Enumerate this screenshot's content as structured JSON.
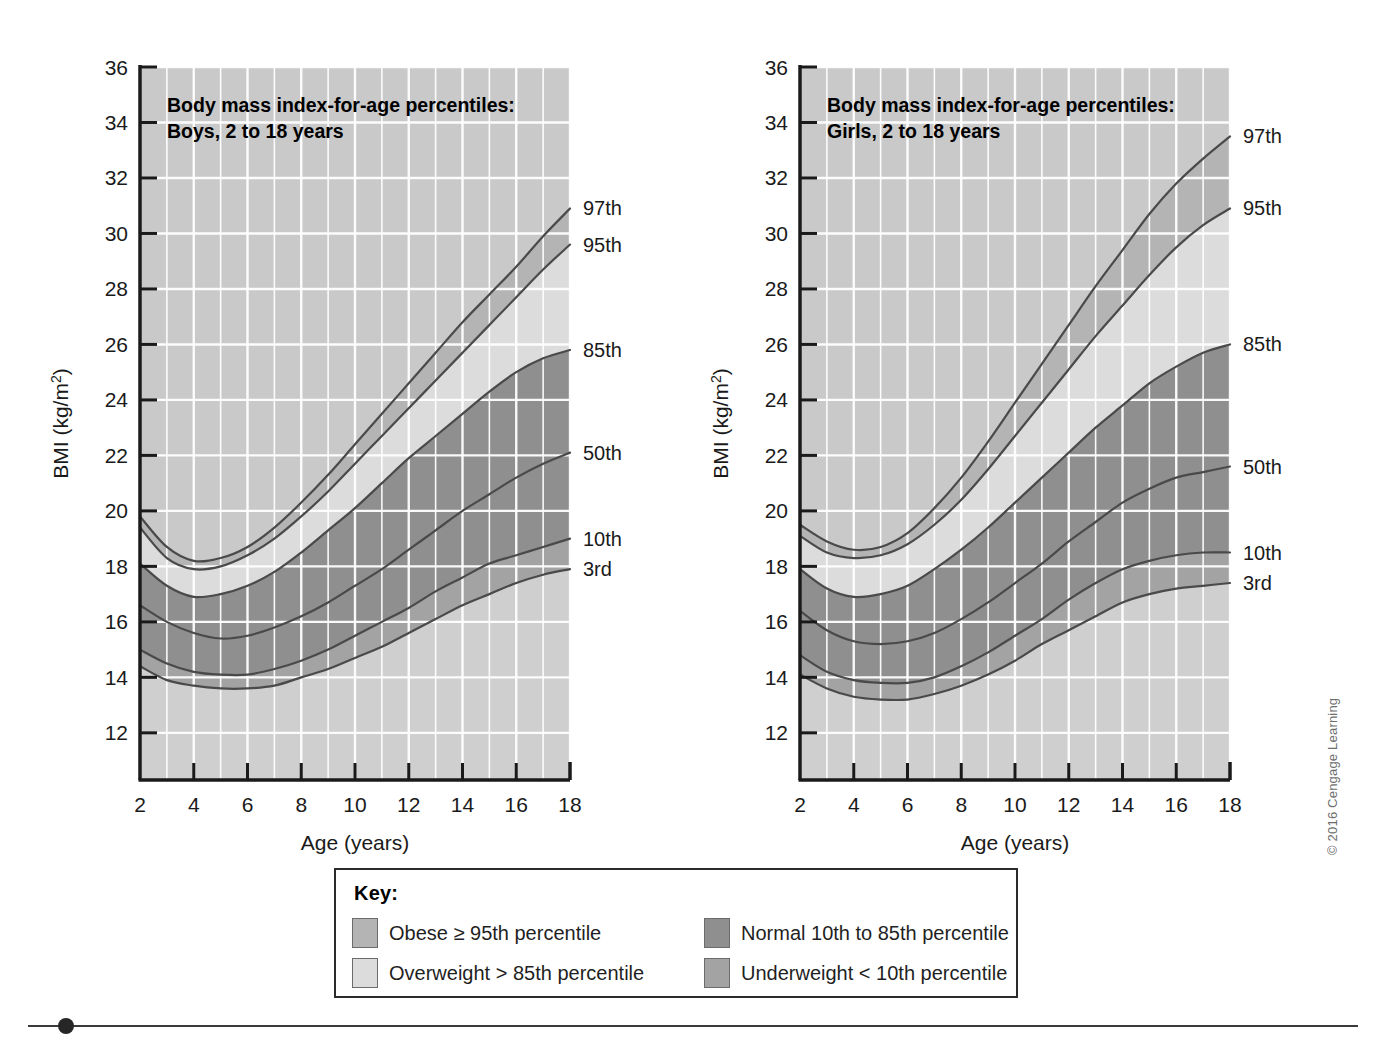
{
  "figure": {
    "copyright": "© 2016 Cengage Learning"
  },
  "legend": {
    "title": "Key:",
    "items": [
      {
        "label": "Obese ≥ 95th percentile",
        "color": "#b4b4b4"
      },
      {
        "label": "Normal 10th to 85th percentile",
        "color": "#8f8f8f"
      },
      {
        "label": "Overweight > 85th percentile",
        "color": "#dcdcdc"
      },
      {
        "label": "Underweight < 10th percentile",
        "color": "#a3a3a3"
      }
    ]
  },
  "charts": [
    {
      "id": "boys",
      "title_line1": "Body mass index-for-age percentiles:",
      "title_line2": "Boys, 2 to 18 years",
      "xlabel": "Age (years)",
      "ylabel": "BMI (kg/m²)",
      "xticks": [
        2,
        4,
        6,
        8,
        10,
        12,
        14,
        16,
        18
      ],
      "yticks": [
        12,
        14,
        16,
        18,
        20,
        22,
        24,
        26,
        28,
        30,
        32,
        34,
        36
      ],
      "xlim": [
        2,
        18
      ],
      "ylim": [
        10.3,
        36
      ],
      "grid": true,
      "end_labels": [
        {
          "text": "97th",
          "value": 30.9
        },
        {
          "text": "95th",
          "value": 29.6
        },
        {
          "text": "85th",
          "value": 25.8
        },
        {
          "text": "50th",
          "value": 22.1
        },
        {
          "text": "10th",
          "value": 19.0
        },
        {
          "text": "3rd",
          "value": 17.9
        }
      ]
    },
    {
      "id": "girls",
      "title_line1": "Body mass index-for-age percentiles:",
      "title_line2": "Girls, 2 to 18 years",
      "xlabel": "Age (years)",
      "ylabel": "BMI (kg/m²)",
      "xticks": [
        2,
        4,
        6,
        8,
        10,
        12,
        14,
        16,
        18
      ],
      "yticks": [
        12,
        14,
        16,
        18,
        20,
        22,
        24,
        26,
        28,
        30,
        32,
        34,
        36
      ],
      "xlim": [
        2,
        18
      ],
      "ylim": [
        10.3,
        36
      ],
      "grid": true,
      "end_labels": [
        {
          "text": "97th",
          "value": 33.5
        },
        {
          "text": "95th",
          "value": 30.9
        },
        {
          "text": "85th",
          "value": 26.0
        },
        {
          "text": "50th",
          "value": 21.6
        },
        {
          "text": "10th",
          "value": 18.5
        },
        {
          "text": "3rd",
          "value": 17.4
        }
      ]
    }
  ],
  "chart_data": [
    {
      "type": "line",
      "id": "boys",
      "title": "Body mass index-for-age percentiles: Boys, 2 to 18 years",
      "xlabel": "Age (years)",
      "ylabel": "BMI (kg/m2)",
      "xlim": [
        2,
        18
      ],
      "ylim": [
        10.3,
        36
      ],
      "grid": true,
      "legend_position": "right-of-plot-end-labels",
      "x": [
        2,
        3,
        4,
        5,
        6,
        7,
        8,
        9,
        10,
        11,
        12,
        13,
        14,
        15,
        16,
        17,
        18
      ],
      "series": [
        {
          "name": "97th",
          "values": [
            19.8,
            18.7,
            18.2,
            18.3,
            18.7,
            19.4,
            20.3,
            21.3,
            22.4,
            23.5,
            24.6,
            25.7,
            26.8,
            27.8,
            28.8,
            29.9,
            30.9
          ]
        },
        {
          "name": "95th",
          "values": [
            19.4,
            18.3,
            17.9,
            18.0,
            18.4,
            19.0,
            19.8,
            20.7,
            21.7,
            22.7,
            23.7,
            24.7,
            25.7,
            26.7,
            27.7,
            28.7,
            29.6
          ]
        },
        {
          "name": "85th",
          "values": [
            18.1,
            17.3,
            16.9,
            17.0,
            17.3,
            17.8,
            18.5,
            19.3,
            20.1,
            21.0,
            21.9,
            22.7,
            23.5,
            24.3,
            25.0,
            25.5,
            25.8
          ]
        },
        {
          "name": "50th",
          "values": [
            16.6,
            16.0,
            15.6,
            15.4,
            15.5,
            15.8,
            16.2,
            16.7,
            17.3,
            17.9,
            18.6,
            19.3,
            20.0,
            20.6,
            21.2,
            21.7,
            22.1
          ]
        },
        {
          "name": "10th",
          "values": [
            15.0,
            14.5,
            14.2,
            14.1,
            14.1,
            14.3,
            14.6,
            15.0,
            15.5,
            16.0,
            16.5,
            17.1,
            17.6,
            18.1,
            18.4,
            18.7,
            19.0
          ]
        },
        {
          "name": "3rd",
          "values": [
            14.4,
            13.9,
            13.7,
            13.6,
            13.6,
            13.7,
            14.0,
            14.3,
            14.7,
            15.1,
            15.6,
            16.1,
            16.6,
            17.0,
            17.4,
            17.7,
            17.9
          ]
        }
      ],
      "bands": [
        {
          "name": "Obese ≥ 95th percentile",
          "upper": "97th",
          "lower": "95th",
          "color": "#b4b4b4"
        },
        {
          "name": "Overweight > 85th percentile",
          "upper": "95th",
          "lower": "85th",
          "color": "#dcdcdc"
        },
        {
          "name": "Normal 10th to 85th percentile",
          "upper": "85th",
          "lower": "10th",
          "color": "#8f8f8f"
        },
        {
          "name": "Underweight < 10th percentile",
          "upper": "10th",
          "lower": "3rd",
          "color": "#a3a3a3"
        }
      ]
    },
    {
      "type": "line",
      "id": "girls",
      "title": "Body mass index-for-age percentiles: Girls, 2 to 18 years",
      "xlabel": "Age (years)",
      "ylabel": "BMI (kg/m2)",
      "xlim": [
        2,
        18
      ],
      "ylim": [
        10.3,
        36
      ],
      "grid": true,
      "legend_position": "right-of-plot-end-labels",
      "x": [
        2,
        3,
        4,
        5,
        6,
        7,
        8,
        9,
        10,
        11,
        12,
        13,
        14,
        15,
        16,
        17,
        18
      ],
      "series": [
        {
          "name": "97th",
          "values": [
            19.5,
            18.9,
            18.6,
            18.7,
            19.2,
            20.1,
            21.2,
            22.5,
            23.9,
            25.3,
            26.7,
            28.1,
            29.4,
            30.7,
            31.8,
            32.7,
            33.5
          ]
        },
        {
          "name": "95th",
          "values": [
            19.1,
            18.5,
            18.3,
            18.4,
            18.8,
            19.5,
            20.4,
            21.5,
            22.7,
            23.9,
            25.1,
            26.3,
            27.4,
            28.5,
            29.5,
            30.3,
            30.9
          ]
        },
        {
          "name": "85th",
          "values": [
            17.9,
            17.2,
            16.9,
            17.0,
            17.3,
            17.9,
            18.6,
            19.4,
            20.3,
            21.2,
            22.1,
            23.0,
            23.8,
            24.6,
            25.2,
            25.7,
            26.0
          ]
        },
        {
          "name": "50th",
          "values": [
            16.4,
            15.7,
            15.3,
            15.2,
            15.3,
            15.6,
            16.1,
            16.7,
            17.4,
            18.1,
            18.9,
            19.6,
            20.3,
            20.8,
            21.2,
            21.4,
            21.6
          ]
        },
        {
          "name": "10th",
          "values": [
            14.8,
            14.2,
            13.9,
            13.8,
            13.8,
            14.0,
            14.4,
            14.9,
            15.5,
            16.1,
            16.8,
            17.4,
            17.9,
            18.2,
            18.4,
            18.5,
            18.5
          ]
        },
        {
          "name": "3rd",
          "values": [
            14.1,
            13.6,
            13.3,
            13.2,
            13.2,
            13.4,
            13.7,
            14.1,
            14.6,
            15.2,
            15.7,
            16.2,
            16.7,
            17.0,
            17.2,
            17.3,
            17.4
          ]
        }
      ],
      "bands": [
        {
          "name": "Obese ≥ 95th percentile",
          "upper": "97th",
          "lower": "95th",
          "color": "#b4b4b4"
        },
        {
          "name": "Overweight > 85th percentile",
          "upper": "95th",
          "lower": "85th",
          "color": "#dcdcdc"
        },
        {
          "name": "Normal 10th to 85th percentile",
          "upper": "85th",
          "lower": "10th",
          "color": "#8f8f8f"
        },
        {
          "name": "Underweight < 10th percentile",
          "upper": "10th",
          "lower": "3rd",
          "color": "#a3a3a3"
        }
      ]
    }
  ]
}
